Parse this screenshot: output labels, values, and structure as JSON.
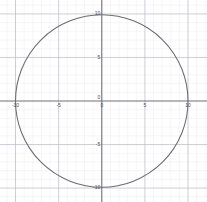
{
  "chart_data": {
    "type": "line",
    "title": "",
    "subtitle": "",
    "xlabel": "",
    "ylabel": "",
    "xlim": [
      -11.8,
      12.2
    ],
    "ylim": [
      -11.6,
      11.6
    ],
    "grid": true,
    "minor_grid": true,
    "minor_grid_step": 1,
    "major_grid_step": 5,
    "legend": "none",
    "aspect": "equal",
    "annotations": [],
    "xticks": [
      {
        "value": -10,
        "label": "-10"
      },
      {
        "value": -5,
        "label": "-5"
      },
      {
        "value": 0,
        "label": "0"
      },
      {
        "value": 5,
        "label": "5"
      },
      {
        "value": 10,
        "label": "10"
      }
    ],
    "yticks": [
      {
        "value": 10,
        "label": "10"
      },
      {
        "value": 5,
        "label": "5"
      },
      {
        "value": -5,
        "label": "-5"
      },
      {
        "value": -10,
        "label": "-10"
      }
    ],
    "series": [
      {
        "name": "circle",
        "shape": "circle",
        "equation": "x^2 + y^2 = 100",
        "center": [
          0,
          0
        ],
        "radius": 10,
        "color": "#6b6b74",
        "points": [
          [
            10,
            0
          ],
          [
            9.95,
            1
          ],
          [
            9.8,
            2
          ],
          [
            9.54,
            3
          ],
          [
            9.17,
            4
          ],
          [
            8.66,
            5
          ],
          [
            8,
            6
          ],
          [
            7.14,
            7
          ],
          [
            6,
            8
          ],
          [
            4.36,
            9
          ],
          [
            3.12,
            9.5
          ],
          [
            0,
            10
          ],
          [
            -3.12,
            9.5
          ],
          [
            -4.36,
            9
          ],
          [
            -6,
            8
          ],
          [
            -7.14,
            7
          ],
          [
            -8,
            6
          ],
          [
            -8.66,
            5
          ],
          [
            -9.17,
            4
          ],
          [
            -9.54,
            3
          ],
          [
            -9.8,
            2
          ],
          [
            -9.95,
            1
          ],
          [
            -10,
            0
          ],
          [
            -9.95,
            -1
          ],
          [
            -9.8,
            -2
          ],
          [
            -9.54,
            -3
          ],
          [
            -9.17,
            -4
          ],
          [
            -8.66,
            -5
          ],
          [
            -8,
            -6
          ],
          [
            -7.14,
            -7
          ],
          [
            -6,
            -8
          ],
          [
            -4.36,
            -9
          ],
          [
            -3.12,
            -9.5
          ],
          [
            0,
            -10
          ],
          [
            3.12,
            -9.5
          ],
          [
            4.36,
            -9
          ],
          [
            6,
            -8
          ],
          [
            7.14,
            -7
          ],
          [
            8,
            -6
          ],
          [
            8.66,
            -5
          ],
          [
            9.17,
            -4
          ],
          [
            9.54,
            -3
          ],
          [
            9.8,
            -2
          ],
          [
            9.95,
            -1
          ],
          [
            10,
            0
          ]
        ]
      }
    ],
    "colors": {
      "background": "#ffffff",
      "axis": "#6f6f7a",
      "major_grid": "#b9b9c4",
      "minor_grid": "#eceaf0",
      "curve": "#6b6b74",
      "tick_text": "#4a4a52"
    }
  }
}
